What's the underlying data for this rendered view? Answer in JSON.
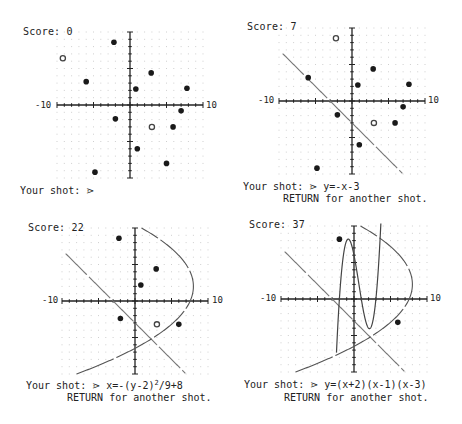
{
  "panels": [
    {
      "score_label": "Score:",
      "score": "0",
      "x_min_label": "-10",
      "x_max_label": "10",
      "prompt_label": "Your shot:",
      "prompt_glyph": "⋗",
      "shot": "",
      "return_msg": "",
      "targets": [
        {
          "x": -2.2,
          "y": 8.6,
          "hit": false
        },
        {
          "x": -9.2,
          "y": 6.4,
          "hit": true
        },
        {
          "x": -6,
          "y": 3.2,
          "hit": false
        },
        {
          "x": 2.9,
          "y": 4.4,
          "hit": false
        },
        {
          "x": 0.8,
          "y": 2.2,
          "hit": false
        },
        {
          "x": 7.8,
          "y": 2.3,
          "hit": false
        },
        {
          "x": 7,
          "y": -0.8,
          "hit": false
        },
        {
          "x": -2,
          "y": -1.9,
          "hit": false
        },
        {
          "x": 3,
          "y": -3,
          "hit": true
        },
        {
          "x": 5.9,
          "y": -3,
          "hit": false
        },
        {
          "x": 1,
          "y": -6,
          "hit": false
        },
        {
          "x": 5,
          "y": -8,
          "hit": false
        },
        {
          "x": -4.8,
          "y": -9.2,
          "hit": false
        }
      ],
      "curves": []
    },
    {
      "score_label": "Score:",
      "score": "7",
      "x_min_label": "-10",
      "x_max_label": "10",
      "prompt_label": "Your shot:",
      "prompt_glyph": "⋗",
      "shot": "y=-x-3",
      "return_msg": "RETURN for another shot.",
      "targets": [
        {
          "x": -2.2,
          "y": 8.6,
          "hit": true
        },
        {
          "x": -6,
          "y": 3.2,
          "hit": false
        },
        {
          "x": 2.9,
          "y": 4.4,
          "hit": false
        },
        {
          "x": 0.8,
          "y": 2.2,
          "hit": false
        },
        {
          "x": 7.8,
          "y": 2.3,
          "hit": false
        },
        {
          "x": 7,
          "y": -0.8,
          "hit": false
        },
        {
          "x": -2,
          "y": -1.9,
          "hit": false
        },
        {
          "x": 3,
          "y": -3,
          "hit": true
        },
        {
          "x": 5.9,
          "y": -3,
          "hit": false
        },
        {
          "x": 1,
          "y": -6,
          "hit": false
        },
        {
          "x": -4.8,
          "y": -9.2,
          "hit": false
        }
      ],
      "curves": [
        "line"
      ]
    },
    {
      "score_label": "Score:",
      "score": "22",
      "x_min_label": "-10",
      "x_max_label": "10",
      "prompt_label": "Your shot:",
      "prompt_glyph": "⋗",
      "shot_prefix": "x=-(y-2)",
      "shot_sup": "2",
      "shot_suffix": "/9+8",
      "return_msg": "RETURN for another shot.",
      "targets": [
        {
          "x": -2.2,
          "y": 8.6,
          "hit": false
        },
        {
          "x": 2.9,
          "y": 4.4,
          "hit": false
        },
        {
          "x": 0.8,
          "y": 2.2,
          "hit": false
        },
        {
          "x": -2,
          "y": -2.4,
          "hit": false
        },
        {
          "x": 3,
          "y": -3.2,
          "hit": true
        },
        {
          "x": 6,
          "y": -3.2,
          "hit": false
        }
      ],
      "curves": [
        "line",
        "parabola"
      ]
    },
    {
      "score_label": "Score:",
      "score": "37",
      "x_min_label": "-10",
      "x_max_label": "10",
      "prompt_label": "Your shot:",
      "prompt_glyph": "⋗",
      "shot": "y=(x+2)(x-1)(x-3)",
      "return_msg": "RETURN for another shot.",
      "targets": [
        {
          "x": -2,
          "y": 8.2,
          "hit": false
        },
        {
          "x": 6,
          "y": -3.2,
          "hit": false
        }
      ],
      "curves": [
        "line",
        "parabola",
        "cubic"
      ]
    }
  ]
}
